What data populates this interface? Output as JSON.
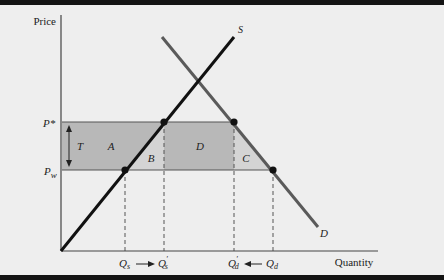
{
  "diagram": {
    "type": "supply-demand-import-quota",
    "axes": {
      "y_label": "Price",
      "x_label": "Quantity"
    },
    "curves": {
      "supply": {
        "label": "S",
        "color": "#111111"
      },
      "demand": {
        "label": "D",
        "color": "#555555"
      }
    },
    "price_levels": {
      "p_star": {
        "label": "P*"
      },
      "p_world": {
        "label": "P",
        "subscript": "w"
      }
    },
    "tariff_label": "T",
    "regions": [
      {
        "id": "A",
        "label": "A",
        "shade": "#b5b5b5"
      },
      {
        "id": "B",
        "label": "B",
        "shade": "#d2d2d2"
      },
      {
        "id": "D",
        "label": "D",
        "shade": "#b5b5b5"
      },
      {
        "id": "C",
        "label": "C",
        "shade": "#d2d2d2"
      }
    ],
    "quantity_ticks": {
      "qs": {
        "label": "Q",
        "subscript": "s"
      },
      "qs_prime": {
        "label": "Q",
        "subscript": "s",
        "prime": "′"
      },
      "qd_prime": {
        "label": "Q",
        "subscript": "d",
        "prime": "′"
      },
      "qd": {
        "label": "Q",
        "subscript": "d"
      }
    }
  }
}
